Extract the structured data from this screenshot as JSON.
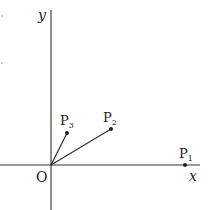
{
  "diagram": {
    "axes": {
      "x_label": "x",
      "y_label": "y",
      "origin_label": "O"
    },
    "points": [
      {
        "name": "P",
        "sub": "1"
      },
      {
        "name": "P",
        "sub": "2"
      },
      {
        "name": "P",
        "sub": "3"
      }
    ],
    "colors": {
      "line": "#333333",
      "background": "#ffffff"
    }
  }
}
